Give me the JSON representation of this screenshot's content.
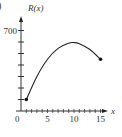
{
  "part_label_fragment": ")",
  "chart_data": {
    "type": "line",
    "title": "",
    "xlabel": "x",
    "ylabel": "R(x)",
    "xlim": [
      0,
      16
    ],
    "ylim": [
      0,
      750
    ],
    "x_ticks": [
      0,
      1,
      2,
      3,
      4,
      5,
      6,
      7,
      8,
      9,
      10,
      11,
      12,
      13,
      14,
      15
    ],
    "x_tick_labels": [
      "0",
      "5",
      "10",
      "15"
    ],
    "y_ticks": [
      100,
      200,
      300,
      400,
      500,
      600,
      700
    ],
    "y_tick_labels": [
      "700"
    ],
    "grid": false,
    "series": [
      {
        "name": "R(x)",
        "x": [
          1,
          3,
          5,
          7,
          9,
          10,
          11,
          13,
          15
        ],
        "values": [
          100,
          300,
          450,
          545,
          590,
          595,
          585,
          535,
          450
        ],
        "endpoints": "closed dots at both ends",
        "color": "#222222"
      }
    ]
  }
}
